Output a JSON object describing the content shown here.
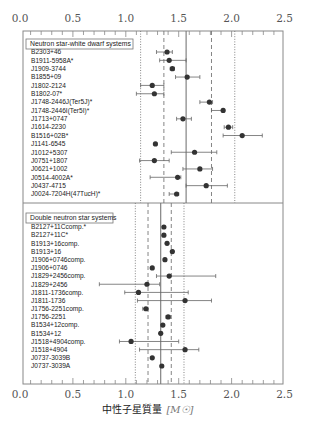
{
  "chart_data": {
    "type": "scatter",
    "title": "",
    "xlabel": "中性子星質量",
    "xlabel_unit": "[M☉]",
    "ylabel": "",
    "xlim": [
      0.0,
      2.5
    ],
    "x_ticks": [
      "0.0",
      "0.5",
      "1.0",
      "1.5",
      "2.0",
      "2.5"
    ],
    "grid": false,
    "panels": [
      {
        "legend": "Neutron star-white dwarf systems",
        "reference_lines": [
          {
            "x": 1.14,
            "style": "dotted"
          },
          {
            "x": 1.36,
            "style": "dashed"
          },
          {
            "x": 1.57,
            "style": "solid"
          },
          {
            "x": 1.81,
            "style": "dashed"
          },
          {
            "x": 2.03,
            "style": "dotted"
          }
        ],
        "points": [
          {
            "name": "B2303+46",
            "mass": 1.39,
            "lo": 1.29,
            "hi": 1.44
          },
          {
            "name": "B1911-5958A*",
            "mass": 1.41,
            "lo": 1.32,
            "hi": 1.57
          },
          {
            "name": "J1909-3744",
            "mass": 1.44,
            "lo": 1.42,
            "hi": 1.46
          },
          {
            "name": "B1855+09",
            "mass": 1.58,
            "lo": 1.47,
            "hi": 1.7
          },
          {
            "name": "J1802-2124",
            "mass": 1.25,
            "lo": 1.14,
            "hi": 1.36
          },
          {
            "name": "B1802-07*",
            "mass": 1.27,
            "lo": 1.1,
            "hi": 1.36
          },
          {
            "name": "J1748-2446J(Ter5J)*",
            "mass": 1.79,
            "lo": 1.7,
            "hi": 1.82
          },
          {
            "name": "J1748-2446I(Ter5I)*",
            "mass": 1.92,
            "lo": 1.81,
            "hi": 1.93
          },
          {
            "name": "J1713+0747",
            "mass": 1.54,
            "lo": 1.48,
            "hi": 1.62
          },
          {
            "name": "J1614-2230",
            "mass": 1.97,
            "lo": 1.93,
            "hi": 2.01
          },
          {
            "name": "B1516+02B*",
            "mass": 2.1,
            "lo": 1.92,
            "hi": 2.29
          },
          {
            "name": "J1141-6545",
            "mass": 1.28,
            "lo": 1.27,
            "hi": 1.29
          },
          {
            "name": "J1012+5307",
            "mass": 1.65,
            "lo": 1.43,
            "hi": 1.86
          },
          {
            "name": "J0751+1807",
            "mass": 1.27,
            "lo": 1.13,
            "hi": 1.41
          },
          {
            "name": "J0621+1002",
            "mass": 1.7,
            "lo": 1.54,
            "hi": 1.82
          },
          {
            "name": "J0514-4002A*",
            "mass": 1.49,
            "lo": 1.23,
            "hi": 1.52
          },
          {
            "name": "J0437-4715",
            "mass": 1.76,
            "lo": 1.57,
            "hi": 1.96
          },
          {
            "name": "J0024-7204H(47TucH)*",
            "mass": 1.48,
            "lo": 1.41,
            "hi": 1.5
          }
        ]
      },
      {
        "legend": "Double neutron star systems",
        "reference_lines": [
          {
            "x": 1.09,
            "style": "dotted"
          },
          {
            "x": 1.21,
            "style": "dashed"
          },
          {
            "x": 1.33,
            "style": "solid"
          },
          {
            "x": 1.43,
            "style": "dashed"
          },
          {
            "x": 1.55,
            "style": "dotted"
          }
        ],
        "points": [
          {
            "name": "B2127+11Ccomp.*",
            "mass": 1.36,
            "lo": 1.35,
            "hi": 1.37
          },
          {
            "name": "B2127+11C*",
            "mass": 1.36,
            "lo": 1.35,
            "hi": 1.37
          },
          {
            "name": "B1913+16comp.",
            "mass": 1.39,
            "lo": 1.38,
            "hi": 1.4
          },
          {
            "name": "B1913+16",
            "mass": 1.44,
            "lo": 1.43,
            "hi": 1.45
          },
          {
            "name": "J1906+0746comp.",
            "mass": 1.37,
            "lo": 1.36,
            "hi": 1.38
          },
          {
            "name": "J1906+0746",
            "mass": 1.25,
            "lo": 1.24,
            "hi": 1.26
          },
          {
            "name": "J1829+2456comp.",
            "mass": 1.41,
            "lo": 1.29,
            "hi": 1.85
          },
          {
            "name": "J1829+2456",
            "mass": 1.2,
            "lo": 0.75,
            "hi": 1.32
          },
          {
            "name": "J1811-1736comp.",
            "mass": 1.12,
            "lo": 0.99,
            "hi": 1.59
          },
          {
            "name": "J1811-1736",
            "mass": 1.56,
            "lo": 1.11,
            "hi": 1.81
          },
          {
            "name": "J1756-2251comp.",
            "mass": 1.19,
            "lo": 1.16,
            "hi": 1.21
          },
          {
            "name": "J1756-2251",
            "mass": 1.4,
            "lo": 1.38,
            "hi": 1.42
          },
          {
            "name": "B1534+12comp.",
            "mass": 1.35,
            "lo": 1.34,
            "hi": 1.36
          },
          {
            "name": "B1534+12",
            "mass": 1.33,
            "lo": 1.32,
            "hi": 1.34
          },
          {
            "name": "J1518+4904comp.",
            "mass": 1.05,
            "lo": 0.94,
            "hi": 1.5
          },
          {
            "name": "J1518+4904",
            "mass": 1.56,
            "lo": 1.13,
            "hi": 1.69
          },
          {
            "name": "J0737-3039B",
            "mass": 1.25,
            "lo": 1.24,
            "hi": 1.26
          },
          {
            "name": "J0737-3039A",
            "mass": 1.34,
            "lo": 1.33,
            "hi": 1.35
          }
        ]
      }
    ]
  },
  "colors": {
    "marker": "#333333",
    "line": "#777777",
    "frame": "#888888",
    "background": "#ffffff"
  }
}
